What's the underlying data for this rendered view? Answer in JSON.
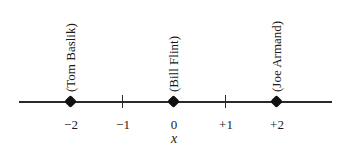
{
  "diagram": {
    "type": "number-line",
    "axis_variable": "x",
    "ticks": [
      {
        "value": -2,
        "label": "−2"
      },
      {
        "value": -1,
        "label": "−1"
      },
      {
        "value": 0,
        "label": "0"
      },
      {
        "value": 1,
        "label": "+1"
      },
      {
        "value": 2,
        "label": "+2"
      }
    ],
    "points": [
      {
        "name": "Tom Baslik",
        "label": "(Tom Baslik)",
        "value": -2
      },
      {
        "name": "Bill Flint",
        "label": "(Bill Flint)",
        "value": 0
      },
      {
        "name": "Joe Armand",
        "label": "(Joe Armand)",
        "value": 2
      }
    ],
    "colors": {
      "line": "#2a2a2a",
      "point": "#111111",
      "background": "#ffffff"
    }
  }
}
